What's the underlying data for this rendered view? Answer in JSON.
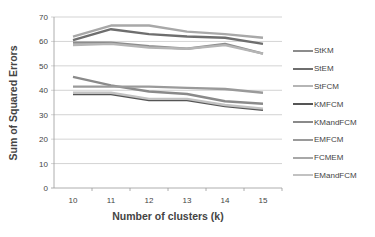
{
  "chart_data": {
    "type": "line",
    "title": "",
    "xlabel": "Number of clusters (k)",
    "ylabel": "Sum of Squared Errors",
    "x": [
      10,
      11,
      12,
      13,
      14,
      15
    ],
    "ylim": [
      0,
      70
    ],
    "yticks": [
      0,
      10,
      20,
      30,
      40,
      50,
      60,
      70
    ],
    "grid": true,
    "legend_position": "right",
    "series": [
      {
        "name": "StKM",
        "color": "#8c8c8c",
        "values": [
          59.5,
          59.5,
          58,
          57,
          59,
          55
        ]
      },
      {
        "name": "StEM",
        "color": "#6e6e6e",
        "values": [
          60.5,
          65,
          63,
          62,
          61.5,
          59
        ]
      },
      {
        "name": "StFCM",
        "color": "#b5b5b5",
        "values": [
          58.5,
          59,
          57.5,
          57,
          58.5,
          55
        ]
      },
      {
        "name": "KMFCM",
        "color": "#555555",
        "values": [
          38.5,
          38.5,
          36,
          36,
          33.5,
          32
        ]
      },
      {
        "name": "KMandFCM",
        "color": "#8a8a8a",
        "values": [
          45.5,
          42,
          39.5,
          38.5,
          35.5,
          34.5
        ]
      },
      {
        "name": "EMFCM",
        "color": "#9a9a9a",
        "values": [
          41.5,
          41.5,
          41.5,
          41,
          40.5,
          39
        ]
      },
      {
        "name": "FCMEM",
        "color": "#a8a8a8",
        "values": [
          62,
          66.5,
          66.5,
          64,
          63,
          61.5
        ]
      },
      {
        "name": "EMandFCM",
        "color": "#c2c2c2",
        "values": [
          39,
          39,
          36.5,
          36.5,
          34,
          32.5
        ]
      }
    ]
  }
}
